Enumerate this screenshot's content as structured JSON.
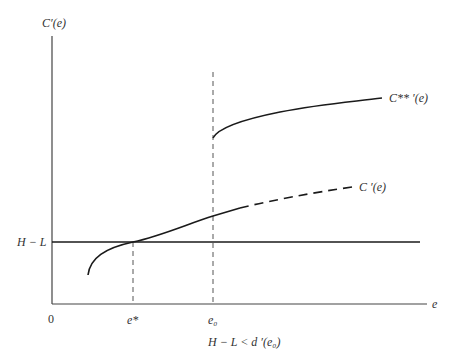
{
  "diagram": {
    "y_axis_label": "C′(e)",
    "x_axis_label": "e",
    "origin_label": "0",
    "hline_label": "H − L",
    "tick_labels": {
      "e_star": "e*",
      "e_zero": "e₀"
    },
    "curves": {
      "upper_label": "C** ′(e)",
      "lower_label": "C ′(e)"
    },
    "caption": "H − L < d ′(e₀)",
    "colors": {
      "line": "#1a1a1a",
      "axis": "#444444",
      "dashed": "#555555",
      "text": "#333333"
    }
  }
}
